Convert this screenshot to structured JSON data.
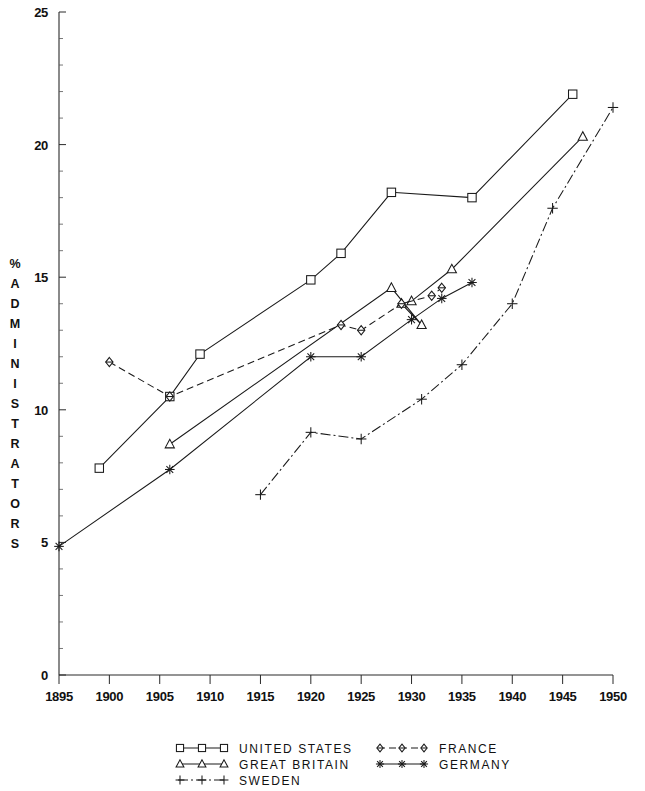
{
  "chart_data": {
    "type": "line",
    "title": "",
    "subtitle": "",
    "xlabel": "",
    "ylabel": "% ADMINISTRATORS",
    "xlim": [
      1895,
      1950
    ],
    "ylim": [
      0,
      25
    ],
    "xticks": [
      1895,
      1900,
      1905,
      1910,
      1915,
      1920,
      1925,
      1930,
      1935,
      1940,
      1945,
      1950
    ],
    "yticks": [
      0,
      5,
      10,
      15,
      20,
      25
    ],
    "xtick_labels": [
      "1895",
      "1900",
      "1905",
      "1910",
      "1915",
      "1920",
      "1925",
      "1930",
      "1935",
      "1940",
      "1945",
      "1950"
    ],
    "ytick_labels": [
      "0",
      "5",
      "10",
      "15",
      "20",
      "25"
    ],
    "grid": false,
    "legend_position": "bottom",
    "series": [
      {
        "name": "UNITED STATES",
        "marker": "square",
        "linestyle": "solid",
        "points": [
          [
            1899,
            7.8
          ],
          [
            1906,
            10.5
          ],
          [
            1909,
            12.1
          ],
          [
            1920,
            14.9
          ],
          [
            1923,
            15.9
          ],
          [
            1928,
            18.2
          ],
          [
            1936,
            18.0
          ],
          [
            1946,
            21.9
          ]
        ]
      },
      {
        "name": "GREAT BRITAIN",
        "marker": "triangle",
        "linestyle": "solid",
        "points": [
          [
            1906,
            8.7
          ],
          [
            1928,
            14.6
          ],
          [
            1931,
            13.2
          ],
          [
            1929,
            14.0
          ],
          [
            1930,
            14.1
          ],
          [
            1934,
            15.3
          ],
          [
            1947,
            20.3
          ]
        ]
      },
      {
        "name": "SWEDEN",
        "marker": "plus",
        "linestyle": "dashdot",
        "points": [
          [
            1915,
            6.8
          ],
          [
            1920,
            9.15
          ],
          [
            1925,
            8.9
          ],
          [
            1931,
            10.4
          ],
          [
            1935,
            11.7
          ],
          [
            1940,
            14.0
          ],
          [
            1944,
            17.6
          ],
          [
            1950,
            21.4
          ]
        ]
      },
      {
        "name": "FRANCE",
        "marker": "diamond",
        "linestyle": "dashed",
        "points": [
          [
            1900,
            11.8
          ],
          [
            1906,
            10.5
          ],
          [
            1923,
            13.2
          ],
          [
            1925,
            13.0
          ],
          [
            1929,
            14.0
          ],
          [
            1932,
            14.3
          ],
          [
            1933,
            14.6
          ]
        ]
      },
      {
        "name": "GERMANY",
        "marker": "asterisk",
        "linestyle": "solid",
        "points": [
          [
            1895,
            4.85
          ],
          [
            1906,
            7.75
          ],
          [
            1920,
            12.0
          ],
          [
            1925,
            12.0
          ],
          [
            1930,
            13.4
          ],
          [
            1933,
            14.2
          ],
          [
            1936,
            14.8
          ]
        ]
      }
    ]
  },
  "axes": {
    "y_axis_label": "% ADMINISTRATORS",
    "y_axis_label_chars": [
      "%",
      "A",
      "D",
      "M",
      "I",
      "N",
      "I",
      "S",
      "T",
      "R",
      "A",
      "T",
      "O",
      "R",
      "S"
    ]
  },
  "legend": {
    "entries": [
      {
        "label": "UNITED STATES",
        "marker": "square",
        "linestyle": "solid",
        "column": 0,
        "row": 0
      },
      {
        "label": "GREAT BRITAIN",
        "marker": "triangle",
        "linestyle": "solid",
        "column": 0,
        "row": 1
      },
      {
        "label": "SWEDEN",
        "marker": "plus",
        "linestyle": "dashdot",
        "column": 0,
        "row": 2
      },
      {
        "label": "FRANCE",
        "marker": "diamond",
        "linestyle": "dashed",
        "column": 1,
        "row": 0
      },
      {
        "label": "GERMANY",
        "marker": "asterisk",
        "linestyle": "solid",
        "column": 1,
        "row": 1
      }
    ]
  },
  "colors": {
    "ink": "#1a1a1a",
    "axis": "#2a2a2a",
    "background": "#ffffff"
  }
}
